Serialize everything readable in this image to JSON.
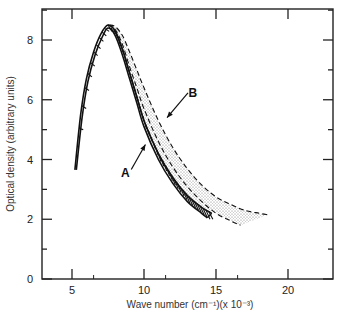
{
  "chart_data": {
    "type": "line",
    "title": "",
    "xlabel": "Wave number (cm⁻¹)(x 10⁻³)",
    "ylabel": "Optical density (arbitrary units)",
    "xlim": [
      3,
      21.5
    ],
    "ylim": [
      0,
      9
    ],
    "x_ticks": [
      5,
      10,
      15,
      20
    ],
    "y_ticks": [
      0,
      2,
      4,
      6,
      8
    ],
    "grid": false,
    "legend": null,
    "annotations": [
      {
        "label": "A",
        "points_to": "hatched band",
        "text_at": [
          8.7,
          3.4
        ],
        "arrow_to": [
          10.1,
          4.5
        ]
      },
      {
        "label": "B",
        "points_to": "stippled band",
        "text_at": [
          13.4,
          6.1
        ],
        "arrow_to": [
          11.6,
          5.4
        ]
      }
    ],
    "series": [
      {
        "name": "A (hatched band, upper edge)",
        "style": "solid",
        "x": [
          5.2,
          5.6,
          6.0,
          6.5,
          7.0,
          7.5,
          8.0,
          8.5,
          9.0,
          9.5,
          10.0,
          11.0,
          12.0,
          13.0,
          14.0,
          14.7
        ],
        "values": [
          3.65,
          5.5,
          6.7,
          7.6,
          8.2,
          8.5,
          8.3,
          7.7,
          6.9,
          6.1,
          5.3,
          4.2,
          3.4,
          2.8,
          2.4,
          2.2
        ]
      },
      {
        "name": "A (hatched band, lower edge)",
        "style": "solid",
        "x": [
          5.3,
          5.7,
          6.1,
          6.6,
          7.1,
          7.5,
          8.0,
          8.5,
          9.0,
          9.5,
          10.0,
          11.0,
          12.0,
          13.0,
          14.0,
          14.4
        ],
        "values": [
          3.65,
          5.4,
          6.6,
          7.5,
          8.1,
          8.4,
          8.15,
          7.5,
          6.7,
          5.9,
          5.1,
          4.0,
          3.2,
          2.6,
          2.2,
          2.05
        ]
      },
      {
        "name": "B (stippled band, inner dashed edge)",
        "style": "dashed",
        "x": [
          7.5,
          8.0,
          8.5,
          9.0,
          9.5,
          10.0,
          11.0,
          12.0,
          13.0,
          14.0,
          15.0,
          16.0,
          16.7
        ],
        "values": [
          8.5,
          8.35,
          7.85,
          7.1,
          6.4,
          5.7,
          4.6,
          3.75,
          3.1,
          2.6,
          2.2,
          1.95,
          1.8
        ]
      },
      {
        "name": "B (stippled band, outer dashed edge)",
        "style": "dashed",
        "x": [
          7.6,
          8.0,
          8.5,
          9.0,
          9.5,
          10.0,
          11.0,
          12.0,
          13.0,
          14.0,
          15.0,
          16.0,
          17.0,
          18.0,
          18.6
        ],
        "values": [
          8.5,
          8.45,
          8.15,
          7.6,
          7.0,
          6.4,
          5.3,
          4.4,
          3.7,
          3.15,
          2.75,
          2.5,
          2.3,
          2.2,
          2.15
        ]
      }
    ]
  }
}
